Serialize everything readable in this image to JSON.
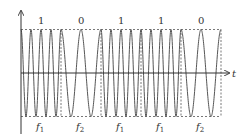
{
  "diagram": {
    "axis": {
      "t_label": "t"
    },
    "bits": [
      "1",
      "0",
      "1",
      "1",
      "0"
    ],
    "freq_labels": [
      {
        "base": "f",
        "sub": "1"
      },
      {
        "base": "f",
        "sub": "2"
      },
      {
        "base": "f",
        "sub": "1"
      },
      {
        "base": "f",
        "sub": "1"
      },
      {
        "base": "f",
        "sub": "2"
      }
    ],
    "cycles_per_segment": {
      "f1": 4,
      "f2": 2
    },
    "colors": {
      "wave": "#555555",
      "axis": "#333333",
      "dash": "#555555"
    }
  }
}
